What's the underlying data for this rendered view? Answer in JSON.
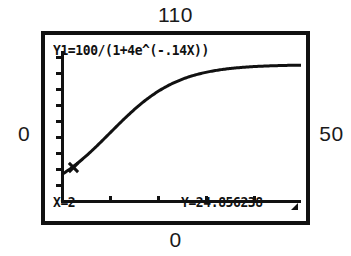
{
  "screen": {
    "device": "graphing-calculator",
    "mode_label": "TRACE",
    "equation": "Y1=100/(1+4e^(-.14X))",
    "trace_x": "X=2",
    "trace_y": "Y=24.856238",
    "busy_indicator": "busy-square-icon",
    "colors": {
      "ink": "#111111",
      "background": "#ffffff"
    }
  },
  "window": {
    "ymax_label": "110",
    "ymin_label": "0",
    "xmin_label": "0",
    "xmax_label": "50"
  },
  "chart_data": {
    "type": "line",
    "title": "",
    "xlabel": "",
    "ylabel": "",
    "equation": "y = 100/(1 + 4e^(-0.14x))",
    "xlim": [
      0,
      50
    ],
    "ylim": [
      0,
      110
    ],
    "grid": false,
    "legend": "none",
    "axes": {
      "x_ticks": [
        10,
        20,
        30,
        40
      ],
      "y_ticks": [
        10,
        20,
        30,
        40,
        50,
        60,
        70,
        80,
        90,
        100
      ]
    },
    "annotations": [
      {
        "name": "trace-cursor",
        "x": 2,
        "y": 24.856238,
        "label": "X=2  Y=24.856238"
      }
    ],
    "series": [
      {
        "name": "Y1",
        "x": [
          0,
          2,
          4,
          6,
          8,
          10,
          12,
          14,
          16,
          18,
          20,
          22,
          24,
          26,
          28,
          30,
          32,
          34,
          36,
          38,
          40,
          42,
          44,
          46,
          48,
          50
        ],
        "values": [
          20.0,
          24.86,
          30.45,
          36.68,
          43.39,
          50.33,
          57.2,
          63.7,
          69.6,
          74.75,
          79.13,
          82.78,
          85.77,
          88.2,
          90.16,
          91.73,
          92.98,
          93.98,
          94.77,
          95.4,
          95.9,
          96.3,
          96.61,
          96.87,
          97.07,
          97.24
        ]
      }
    ]
  }
}
